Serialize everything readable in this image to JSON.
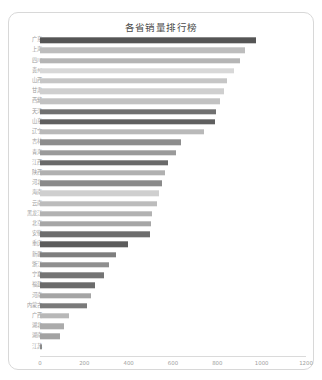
{
  "card": {
    "title": "各省销量排行榜"
  },
  "chart_data": {
    "type": "bar",
    "orientation": "horizontal",
    "title": "各省销量排行榜",
    "xlabel": "",
    "ylabel": "",
    "xlim": [
      0,
      1200
    ],
    "grid": false,
    "legend": null,
    "xticks": [
      0,
      200,
      400,
      600,
      800,
      1000,
      1200
    ],
    "categories": [
      "广东",
      "上海",
      "四川",
      "贵州",
      "山西",
      "甘肃",
      "西藏",
      "天津",
      "山东",
      "辽宁",
      "吉林",
      "青海",
      "江西",
      "陕西",
      "河北",
      "海南",
      "云南",
      "黑龙江",
      "北京",
      "安徽",
      "重庆",
      "新疆",
      "浙江",
      "宁夏",
      "福建",
      "河南",
      "内蒙古",
      "广西",
      "湖北",
      "湖南",
      "江苏"
    ],
    "values": [
      980,
      930,
      910,
      880,
      850,
      835,
      820,
      800,
      795,
      745,
      640,
      620,
      580,
      570,
      555,
      540,
      530,
      510,
      505,
      500,
      400,
      345,
      315,
      290,
      250,
      230,
      215,
      130,
      110,
      90,
      10
    ],
    "bar_colors": [
      "#555555",
      "#bdbdbd",
      "#b5b5b5",
      "#d8d8d8",
      "#c6c6c6",
      "#cfcfcf",
      "#c2c2c2",
      "#707070",
      "#5f5f5f",
      "#b9b9b9",
      "#8d8d8d",
      "#9a9a9a",
      "#6a6a6a",
      "#b0b0b0",
      "#8a8a8a",
      "#cfcfcf",
      "#bcbcbc",
      "#b2b2b2",
      "#a6a6a6",
      "#6d6d6d",
      "#5c5c5c",
      "#7e7e7e",
      "#8f8f8f",
      "#747474",
      "#6b6b6b",
      "#a5a5a5",
      "#7a7a7a",
      "#b8b8b8",
      "#ababab",
      "#a2a2a2",
      "#8a8a8a"
    ]
  }
}
